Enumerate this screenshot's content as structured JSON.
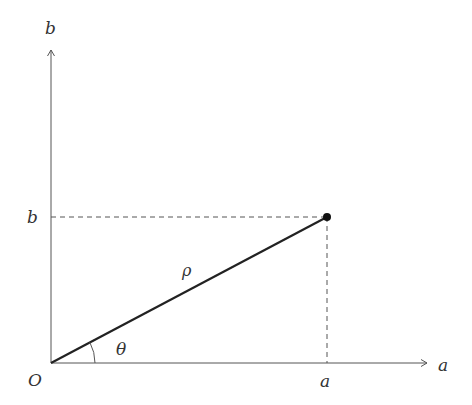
{
  "diagram": {
    "type": "polar-coordinate-diagram",
    "axes": {
      "x_label": "a",
      "y_label": "b",
      "origin_label": "O"
    },
    "point": {
      "x_tick_label": "a",
      "y_tick_label": "b"
    },
    "segment_label": "ρ",
    "angle_label": "θ",
    "colors": {
      "axis": "#555555",
      "segment": "#222222",
      "dashed": "#555555",
      "text": "#333333"
    }
  }
}
